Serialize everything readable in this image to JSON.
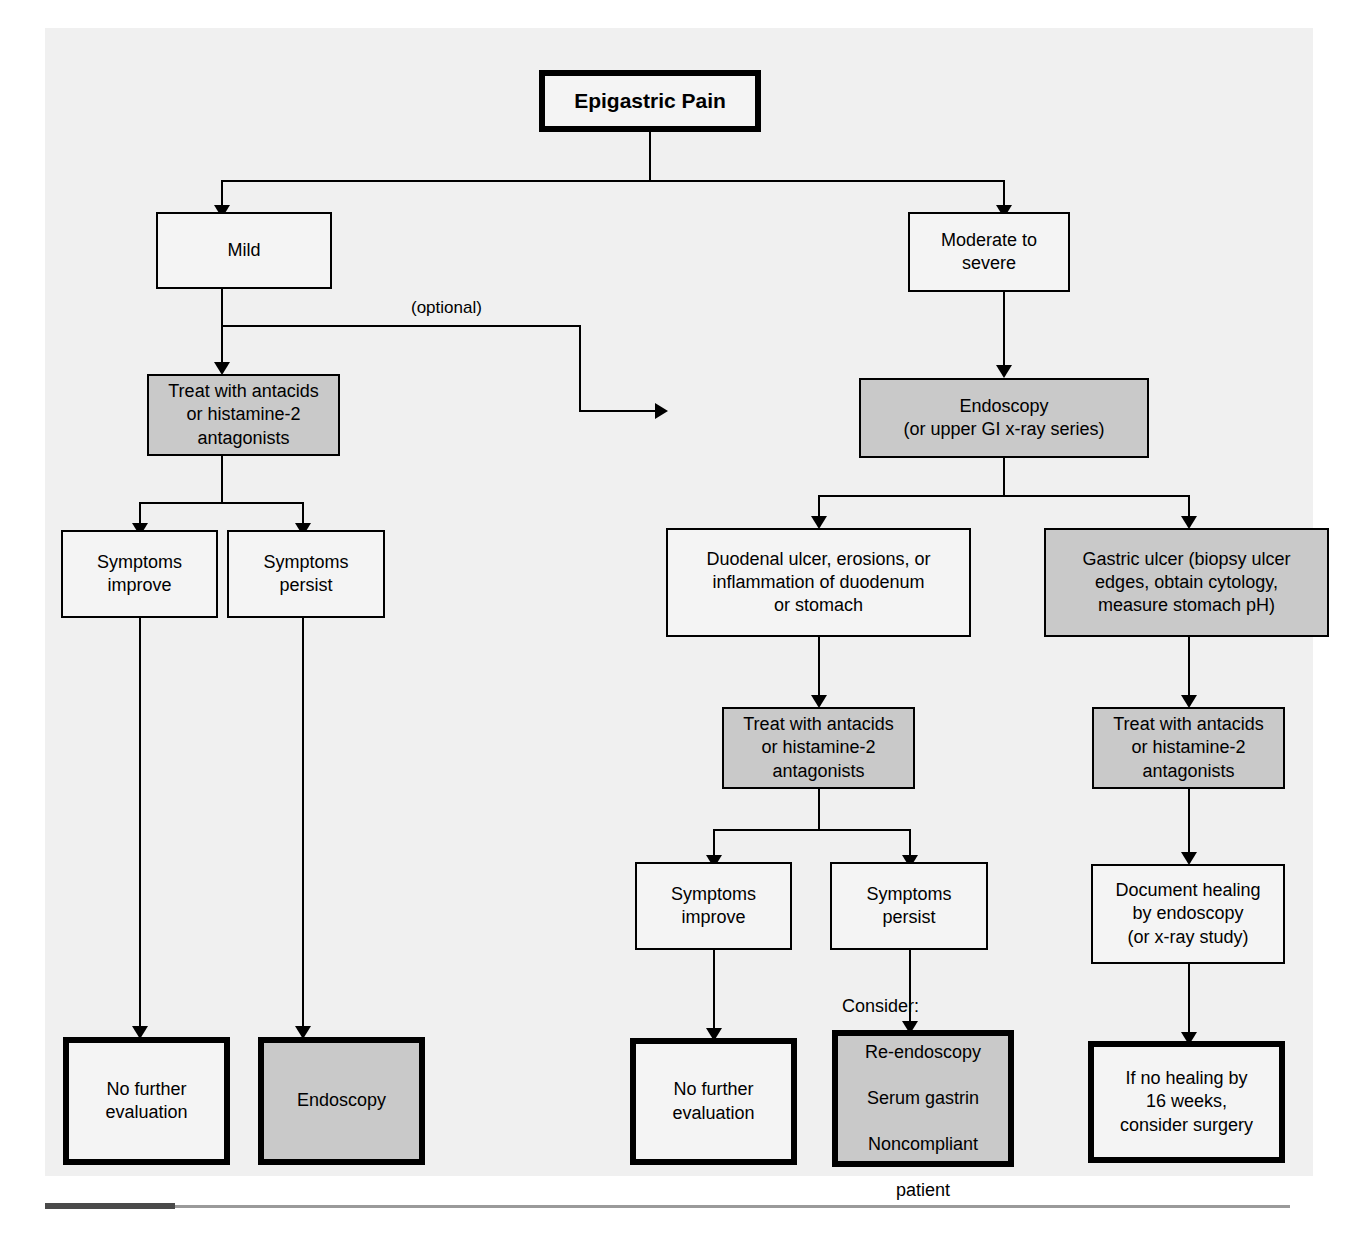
{
  "diagram": {
    "title": "Epigastric Pain",
    "type": "clinical-decision-flowchart",
    "edge_labels": [
      {
        "id": "optional",
        "text": "(optional)"
      }
    ],
    "legend": {
      "shaded_fill": "#c9c9c9",
      "plain_fill": "#f4f4f4",
      "line_color": "#000000",
      "panel_background": "#f0f0f0"
    },
    "nodes": [
      {
        "id": "root",
        "text": "Epigastric Pain",
        "style": "plain thick bold"
      },
      {
        "id": "mild",
        "text": "Mild",
        "style": "plain"
      },
      {
        "id": "moderate",
        "text": "Moderate to\nsevere",
        "style": "plain"
      },
      {
        "id": "treat-left",
        "text": "Treat with antacids\nor histamine-2\nantagonists",
        "style": "shaded"
      },
      {
        "id": "endoscopy-main",
        "text": "Endoscopy\n(or upper GI x-ray series)",
        "style": "shaded"
      },
      {
        "id": "sym-improve-l",
        "text": "Symptoms\nimprove",
        "style": "plain"
      },
      {
        "id": "sym-persist-l",
        "text": "Symptoms\npersist",
        "style": "plain"
      },
      {
        "id": "duodenal",
        "text": "Duodenal ulcer, erosions, or\ninflammation of duodenum\nor stomach",
        "style": "plain"
      },
      {
        "id": "gastric",
        "text": "Gastric ulcer (biopsy ulcer\nedges, obtain cytology,\nmeasure stomach pH)",
        "style": "shaded"
      },
      {
        "id": "treat-mid",
        "text": "Treat with antacids\nor histamine-2\nantagonists",
        "style": "shaded"
      },
      {
        "id": "treat-right",
        "text": "Treat with antacids\nor histamine-2\nantagonists",
        "style": "shaded"
      },
      {
        "id": "sym-improve-m",
        "text": "Symptoms\nimprove",
        "style": "plain"
      },
      {
        "id": "sym-persist-m",
        "text": "Symptoms\npersist",
        "style": "plain"
      },
      {
        "id": "document",
        "text": "Document healing\nby endoscopy\n(or x-ray study)",
        "style": "plain"
      },
      {
        "id": "no-further-l",
        "text": "No further\nevaluation",
        "style": "plain thick"
      },
      {
        "id": "endoscopy-term",
        "text": "Endoscopy",
        "style": "shaded thick"
      },
      {
        "id": "no-further-m",
        "text": "No further\nevaluation",
        "style": "plain thick"
      },
      {
        "id": "consider",
        "text": "Consider:\nRe-endoscopy\nSerum gastrin\nNoncompliant\npatient",
        "style": "shaded thick"
      },
      {
        "id": "no-healing",
        "text": "If no healing by\n16 weeks,\nconsider surgery",
        "style": "plain thick"
      }
    ],
    "consider_lines": {
      "header": "Consider:",
      "items": [
        "Re-endoscopy",
        "Serum gastrin",
        "Noncompliant",
        "patient"
      ]
    },
    "edges": [
      {
        "from": "root",
        "to": "mild"
      },
      {
        "from": "root",
        "to": "moderate"
      },
      {
        "from": "mild",
        "to": "treat-left"
      },
      {
        "from": "mild",
        "to": "endoscopy-main",
        "label": "(optional)"
      },
      {
        "from": "moderate",
        "to": "endoscopy-main"
      },
      {
        "from": "treat-left",
        "to": "sym-improve-l"
      },
      {
        "from": "treat-left",
        "to": "sym-persist-l"
      },
      {
        "from": "sym-improve-l",
        "to": "no-further-l"
      },
      {
        "from": "sym-persist-l",
        "to": "endoscopy-term"
      },
      {
        "from": "endoscopy-main",
        "to": "duodenal"
      },
      {
        "from": "endoscopy-main",
        "to": "gastric"
      },
      {
        "from": "duodenal",
        "to": "treat-mid"
      },
      {
        "from": "gastric",
        "to": "treat-right"
      },
      {
        "from": "treat-mid",
        "to": "sym-improve-m"
      },
      {
        "from": "treat-mid",
        "to": "sym-persist-m"
      },
      {
        "from": "treat-right",
        "to": "document"
      },
      {
        "from": "sym-improve-m",
        "to": "no-further-m"
      },
      {
        "from": "sym-persist-m",
        "to": "consider"
      },
      {
        "from": "document",
        "to": "no-healing"
      }
    ]
  }
}
